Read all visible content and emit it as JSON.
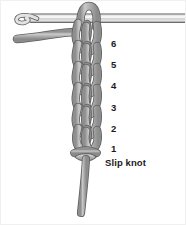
{
  "figure": {
    "background_color": "#ffffff",
    "yarn_color": "#a8a8a8",
    "yarn_outline_color": "#5c5c5c",
    "hook_color": "#d3d3d3",
    "label_color": "#1b1b1b"
  },
  "labels": [
    {
      "text": "6",
      "x": 110,
      "y": 38
    },
    {
      "text": "5",
      "x": 110,
      "y": 59
    },
    {
      "text": "4",
      "x": 110,
      "y": 80
    },
    {
      "text": "3",
      "x": 110,
      "y": 102
    },
    {
      "text": "2",
      "x": 110,
      "y": 123
    },
    {
      "text": "1",
      "x": 110,
      "y": 143
    },
    {
      "text": "Slip knot",
      "x": 104,
      "y": 157
    }
  ],
  "parts": {
    "hook": "crochet-hook",
    "hook_tip": "hook-tip-curl",
    "chain": "chain-stitch-column",
    "slip_knot": "slip-knot",
    "working_yarn": "working-yarn-strand",
    "yarn_tail": "yarn-tail"
  }
}
